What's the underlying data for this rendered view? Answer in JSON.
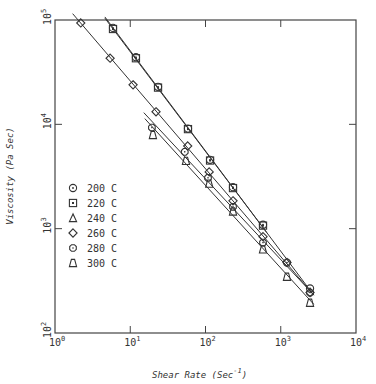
{
  "chart_data": {
    "type": "scatter",
    "title": "",
    "xlabel": "Shear Rate (Sec -1)",
    "ylabel": "Viscosity (Pa Sec)",
    "xscale": "log",
    "yscale": "log",
    "xlim": [
      1,
      10000
    ],
    "ylim": [
      100,
      100000
    ],
    "grid": false,
    "legend_position": "inside-left",
    "x_ticks": [
      {
        "base": "10",
        "exp": "0",
        "value": 1
      },
      {
        "base": "10",
        "exp": "1",
        "value": 10
      },
      {
        "base": "10",
        "exp": "2",
        "value": 100
      },
      {
        "base": "10",
        "exp": "3",
        "value": 1000
      },
      {
        "base": "10",
        "exp": "4",
        "value": 10000
      }
    ],
    "y_ticks": [
      {
        "base": "10",
        "exp": "2",
        "value": 100
      },
      {
        "base": "10",
        "exp": "3",
        "value": 1000
      },
      {
        "base": "10",
        "exp": "4",
        "value": 10000
      },
      {
        "base": "10",
        "exp": "5",
        "value": 100000
      }
    ],
    "series": [
      {
        "name": "200 C",
        "marker": "circle",
        "x": [
          5.9,
          11.9,
          23.4,
          58.5,
          115,
          232,
          581,
          1210,
          2450
        ],
        "y": [
          84000,
          44000,
          22900,
          9100,
          4570,
          2500,
          1090,
          473,
          267
        ]
      },
      {
        "name": "220 C",
        "marker": "square",
        "x": [
          5.9,
          11.9,
          23.4,
          58.5,
          115,
          232,
          581
        ],
        "y": [
          82000,
          43000,
          22500,
          9000,
          4500,
          2450,
          1070
        ]
      },
      {
        "name": "240 C",
        "marker": "triangle",
        "x": [],
        "y": []
      },
      {
        "name": "260 C",
        "marker": "diamond",
        "x": [
          2.2,
          5.4,
          10.9,
          22,
          58,
          112,
          232,
          581,
          1210,
          2450
        ],
        "y": [
          93600,
          43000,
          23900,
          13200,
          6200,
          3500,
          1850,
          838,
          474,
          244
        ]
      },
      {
        "name": "280 C",
        "marker": "hexagon",
        "x": [
          19.4,
          53,
          108,
          232,
          581,
          2450
        ],
        "y": [
          9300,
          5450,
          3070,
          1620,
          735,
          244
        ]
      },
      {
        "name": "300 C",
        "marker": "trapezoid",
        "x": [
          20,
          55,
          112,
          232,
          581,
          1210,
          2450
        ],
        "y": [
          7900,
          4460,
          2700,
          1460,
          632,
          346,
          195
        ]
      }
    ]
  },
  "legend": {
    "items": [
      {
        "label": "200 C",
        "marker": "circle"
      },
      {
        "label": "220 C",
        "marker": "square"
      },
      {
        "label": "240 C",
        "marker": "triangle"
      },
      {
        "label": "260 C",
        "marker": "diamond"
      },
      {
        "label": "280 C",
        "marker": "hexagon"
      },
      {
        "label": "300 C",
        "marker": "trapezoid"
      }
    ]
  },
  "axes": {
    "xlabel_main": "Shear Rate (Sec",
    "xlabel_sup": "-1",
    "xlabel_close": ")",
    "ylabel": "Viscosity (Pa Sec)"
  }
}
